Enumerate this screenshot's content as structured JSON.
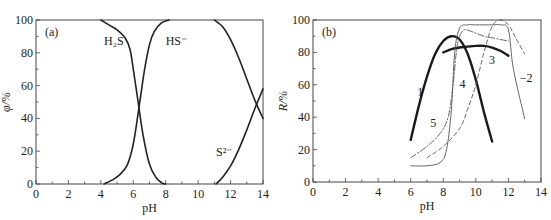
{
  "chart_data": [
    {
      "type": "line",
      "panel_label": "(a)",
      "title": "",
      "xlabel": "pH",
      "ylabel": "φ/%",
      "xlim": [
        0,
        14
      ],
      "ylim": [
        0,
        100
      ],
      "xticks": [
        "0",
        "2",
        "4",
        "6",
        "8",
        "10",
        "12",
        "14"
      ],
      "yticks": [
        "0",
        "20",
        "40",
        "60",
        "80",
        "100"
      ],
      "grid": false,
      "legend": "inline annotations",
      "series": [
        {
          "name": "H2S",
          "label_text": "H₂S",
          "style": "solid",
          "x": [
            4.0,
            4.5,
            5.0,
            5.5,
            5.8,
            6.0,
            6.3,
            6.6,
            7.0,
            7.4,
            7.8,
            8.0
          ],
          "y": [
            100,
            97,
            94,
            89,
            82,
            70,
            50,
            30,
            12,
            4,
            0.5,
            0
          ]
        },
        {
          "name": "HS-",
          "label_text": "HS⁻",
          "style": "solid",
          "x": [
            4.2,
            4.8,
            5.2,
            5.6,
            5.9,
            6.1,
            6.4,
            6.7,
            7.0,
            7.3,
            7.7,
            8.2
          ],
          "y": [
            0,
            3,
            6,
            11,
            20,
            30,
            50,
            70,
            85,
            93,
            98,
            100
          ]
        },
        {
          "name": "HS- (decline)",
          "label_text": "",
          "style": "solid",
          "x": [
            11.0,
            11.5,
            12.0,
            12.5,
            13.0,
            13.5,
            14.0
          ],
          "y": [
            100,
            96,
            88,
            77,
            64,
            51,
            40
          ]
        },
        {
          "name": "S2-",
          "label_text": "S²⁻",
          "style": "solid",
          "x": [
            11.1,
            11.5,
            12.0,
            12.5,
            13.0,
            13.5,
            14.0
          ],
          "y": [
            0,
            4,
            11,
            21,
            33,
            46,
            58
          ]
        }
      ],
      "annotations": [
        {
          "text": "H₂S",
          "x": 4.2,
          "y": 85
        },
        {
          "text": "HS⁻",
          "x": 8.0,
          "y": 85
        },
        {
          "text": "S²⁻",
          "x": 11.1,
          "y": 17
        }
      ]
    },
    {
      "type": "line",
      "panel_label": "(b)",
      "title": "",
      "xlabel": "pH",
      "ylabel": "R/%",
      "xlim": [
        0,
        14
      ],
      "ylim": [
        0,
        100
      ],
      "xticks": [
        "0",
        "2",
        "4",
        "6",
        "8",
        "10",
        "12",
        "14"
      ],
      "yticks": [
        "0",
        "20",
        "40",
        "60",
        "80",
        "100"
      ],
      "grid": false,
      "legend": "inline curve numbers",
      "series": [
        {
          "name": "1",
          "style": "thick",
          "x": [
            6.0,
            6.5,
            7.0,
            7.5,
            8.0,
            8.5,
            9.0,
            9.5,
            10.0,
            10.5,
            11.0
          ],
          "y": [
            26,
            47,
            65,
            79,
            87,
            90,
            88,
            79,
            63,
            43,
            25
          ]
        },
        {
          "name": "2",
          "style": "dashed",
          "x": [
            7.0,
            8.0,
            9.0,
            9.5,
            10.0,
            10.5,
            11.0,
            11.5,
            12.0,
            12.5,
            13.0
          ],
          "y": [
            15,
            22,
            33,
            45,
            60,
            80,
            96,
            100,
            97,
            88,
            79
          ]
        },
        {
          "name": "3",
          "style": "thick",
          "x": [
            8.0,
            8.5,
            9.0,
            10.0,
            10.5,
            11.0,
            11.5,
            12.0
          ],
          "y": [
            80,
            82,
            83,
            84,
            84,
            83,
            81,
            78
          ]
        },
        {
          "name": "4",
          "style": "dashdot",
          "x": [
            6.0,
            7.0,
            7.8,
            8.3,
            8.6,
            8.8,
            9.0,
            9.3,
            9.7,
            10.5,
            11.0,
            12.0
          ],
          "y": [
            15,
            22,
            30,
            40,
            60,
            80,
            90,
            94,
            93,
            90,
            89,
            87
          ]
        },
        {
          "name": "5",
          "style": "thin",
          "x": [
            6.0,
            7.0,
            7.8,
            8.2,
            8.5,
            8.7,
            9.0,
            9.5,
            10.0,
            11.0,
            11.5,
            12.0,
            12.3,
            13.0
          ],
          "y": [
            10,
            10,
            12,
            20,
            45,
            80,
            95,
            97,
            97,
            97,
            97,
            94,
            70,
            39
          ]
        }
      ],
      "annotations": [
        {
          "text": "1",
          "x": 6.4,
          "y": 53
        },
        {
          "text": "−2",
          "x": 12.7,
          "y": 62
        },
        {
          "text": "3",
          "x": 10.8,
          "y": 73
        },
        {
          "text": "4",
          "x": 9.0,
          "y": 58
        },
        {
          "text": "5",
          "x": 7.2,
          "y": 34
        }
      ]
    }
  ]
}
